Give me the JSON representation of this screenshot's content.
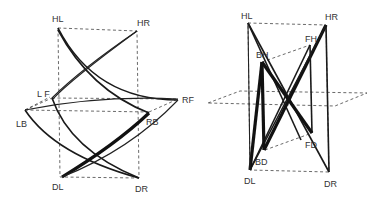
{
  "figure": {
    "left_diagram": {
      "labels": {
        "HL": "HL",
        "HR": "HR",
        "LF": "L F",
        "LB": "LB",
        "RF": "RF",
        "RB": "RB",
        "DL": "DL",
        "DR": "DR"
      }
    },
    "right_diagram": {
      "labels": {
        "HL": "HL",
        "HR": "HR",
        "BH": "BH",
        "FH": "FH",
        "BD": "BD",
        "FD": "FD",
        "DL": "DL",
        "DR": "DR"
      }
    },
    "colors": {
      "line": "#1a1a1a",
      "background": "#ffffff",
      "label": "#333333"
    }
  }
}
